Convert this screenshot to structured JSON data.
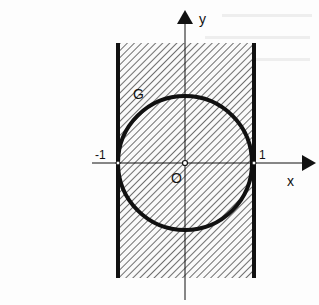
{
  "figure": {
    "type": "coordinate-region-diagram",
    "labels": {
      "x_axis": "x",
      "y_axis": "y",
      "origin": "O",
      "curve": "G",
      "tick_left": "-1",
      "tick_right": "1"
    },
    "colors": {
      "ink": "#111111",
      "background": "#fdfdfd",
      "hatch": "#333333"
    }
  }
}
